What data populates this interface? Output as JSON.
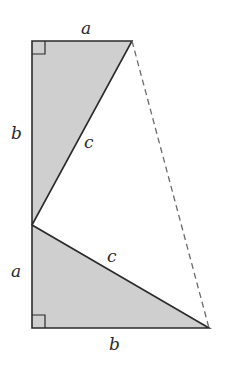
{
  "diagram": {
    "colors": {
      "fill": "#cfcfcf",
      "stroke": "#2b2b2b",
      "dashed": "#6a6a6a",
      "background": "#ffffff"
    },
    "labels": {
      "top_a": "a",
      "left_b": "b",
      "upper_c": "c",
      "left_a": "a",
      "lower_c": "c",
      "bottom_b": "b"
    },
    "vertices": {
      "top_left": [
        32,
        41
      ],
      "top_right": [
        132,
        41
      ],
      "mid_left": [
        32,
        225
      ],
      "bottom_left": [
        32,
        328
      ],
      "bottom_right": [
        209,
        328
      ]
    }
  }
}
